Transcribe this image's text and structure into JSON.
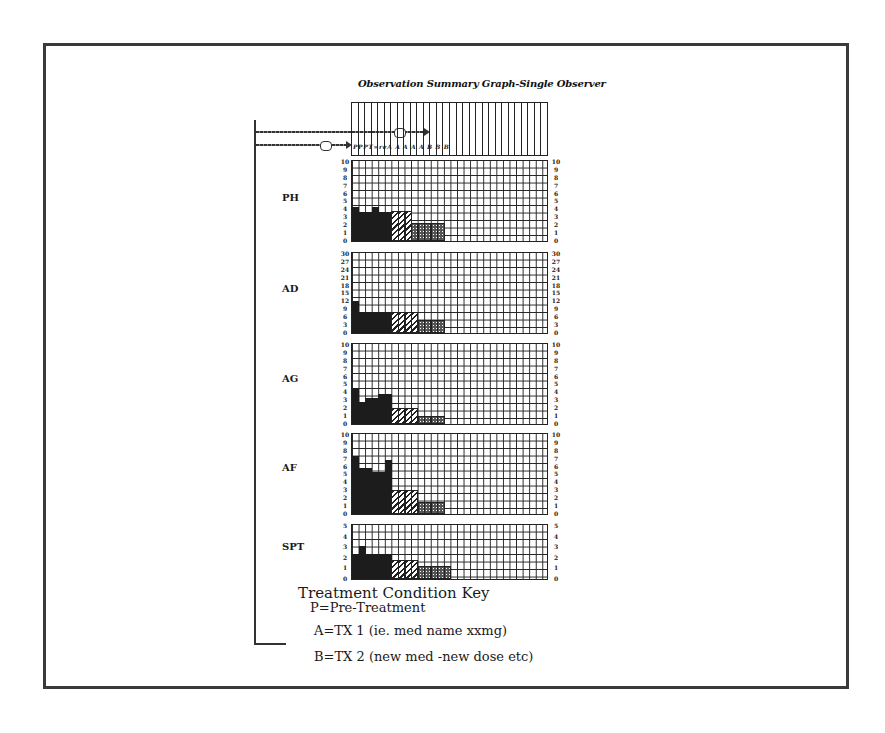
{
  "title": "Observation Summary Graph-Single Observer",
  "header": {
    "columns": 30,
    "session_labels": "PPPT=reA A A A A B B B"
  },
  "chart_data": {
    "type": "bar",
    "title": "Observation Summary Graph-Single Observer",
    "xlabel": "Session",
    "ylabel": "",
    "grid": true,
    "legend_position": "bottom-left",
    "conditions": {
      "P": "Pre-Treatment",
      "A": "TX 1 (ie. med name xxmg)",
      "B": "TX 2 (new med -new dose etc)"
    },
    "columns_total": 30,
    "panels": [
      {
        "label": "PH",
        "ylim": [
          0,
          10
        ],
        "left_ticks": [
          "10",
          "9",
          "8",
          "7",
          "6",
          "5",
          "4",
          "3",
          "2",
          "1",
          "0"
        ],
        "right_ticks": [
          "10",
          "9",
          "8",
          "7",
          "6",
          "5",
          "4",
          "3",
          "2",
          "1",
          "0"
        ],
        "segments": [
          {
            "condition": "P",
            "values": [
              4.2,
              3.6,
              3.6,
              4.2,
              3.6,
              3.6
            ]
          },
          {
            "condition": "A",
            "values": [
              3.8,
              3.8,
              3.8
            ]
          },
          {
            "condition": "B",
            "values": [
              2.2,
              2.2,
              2.2,
              2.2,
              2.2
            ]
          }
        ]
      },
      {
        "label": "AD",
        "ylim": [
          0,
          30
        ],
        "left_ticks": [
          "30",
          "27",
          "24",
          "21",
          "18",
          "15",
          "12",
          "9",
          "6",
          "3",
          "0"
        ],
        "right_ticks": [
          "30",
          "27",
          "24",
          "21",
          "18",
          "15",
          "12",
          "9",
          "6",
          "3",
          "0"
        ],
        "segments": [
          {
            "condition": "P",
            "values": [
              12,
              8,
              8,
              8,
              8,
              8
            ]
          },
          {
            "condition": "A",
            "values": [
              8,
              8,
              8,
              8
            ]
          },
          {
            "condition": "B",
            "values": [
              5,
              5,
              5,
              5
            ]
          }
        ]
      },
      {
        "label": "AG",
        "ylim": [
          0,
          10
        ],
        "left_ticks": [
          "10",
          "9",
          "8",
          "7",
          "6",
          "5",
          "4",
          "3",
          "2",
          "1",
          "0"
        ],
        "right_ticks": [
          "10",
          "9",
          "8",
          "7",
          "6",
          "5",
          "4",
          "3",
          "2",
          "1",
          "0"
        ],
        "segments": [
          {
            "condition": "P",
            "values": [
              4.5,
              2.8,
              3.2,
              3.2,
              3.8,
              3.8
            ]
          },
          {
            "condition": "A",
            "values": [
              2.0,
              2.0,
              2.0,
              2.0
            ]
          },
          {
            "condition": "B",
            "values": [
              1.0,
              1.0,
              1.0,
              1.0
            ]
          }
        ]
      },
      {
        "label": "AF",
        "ylim": [
          0,
          10
        ],
        "left_ticks": [
          "10",
          "9",
          "8",
          "7",
          "6",
          "5",
          "4",
          "3",
          "2",
          "1",
          "0"
        ],
        "right_ticks": [
          "10",
          "9",
          "8",
          "7",
          "6",
          "5",
          "4",
          "3",
          "2",
          "1",
          "0"
        ],
        "segments": [
          {
            "condition": "P",
            "values": [
              7.2,
              5.8,
              5.8,
              5.2,
              5.2,
              6.8
            ]
          },
          {
            "condition": "A",
            "values": [
              3.0,
              3.0,
              3.0,
              3.0
            ]
          },
          {
            "condition": "B",
            "values": [
              1.5,
              1.5,
              1.5,
              1.5
            ]
          }
        ]
      },
      {
        "label": "SPT",
        "ylim": [
          0,
          5
        ],
        "left_ticks": [
          "5",
          "4",
          "3",
          "2",
          "1",
          "0"
        ],
        "right_ticks": [
          "5",
          "4",
          "3",
          "2",
          "1",
          "0"
        ],
        "segments": [
          {
            "condition": "P",
            "values": [
              2.3,
              3.1,
              2.3,
              2.3,
              2.3,
              2.3
            ]
          },
          {
            "condition": "A",
            "values": [
              1.8,
              1.8,
              1.8,
              1.8
            ]
          },
          {
            "condition": "B",
            "values": [
              1.2,
              1.2,
              1.2,
              1.2,
              1.2
            ]
          }
        ]
      }
    ]
  },
  "key": {
    "title": "Treatment Condition Key",
    "items": [
      "P=Pre-Treatment",
      "A=TX 1 (ie. med name xxmg)",
      "B=TX 2 (new med -new dose etc)"
    ]
  }
}
